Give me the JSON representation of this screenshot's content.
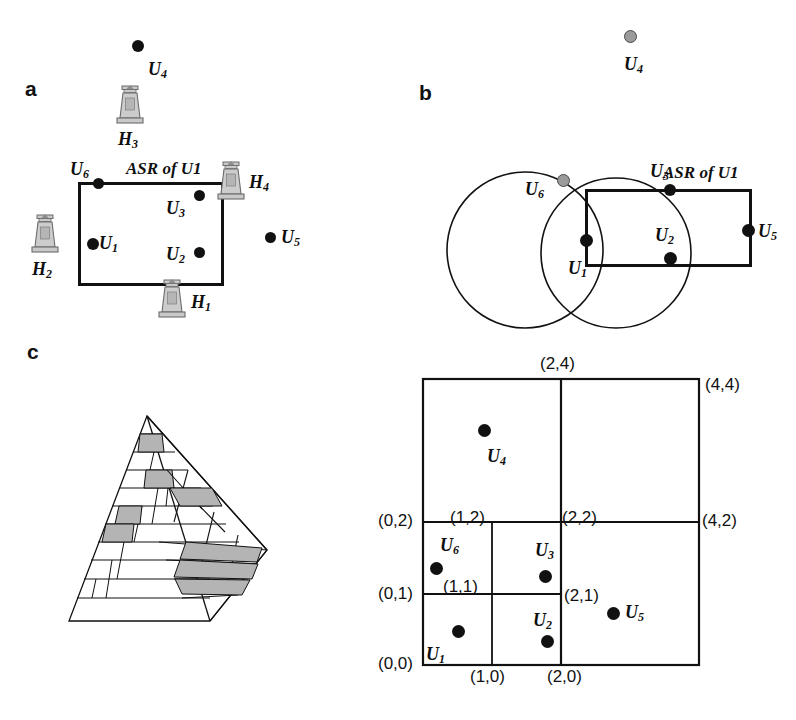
{
  "figure": {
    "panels": [
      {
        "id": "a",
        "label": "a",
        "caption": "ASR of U1",
        "users": [
          {
            "id": "U4",
            "label": "U",
            "sub": "4"
          },
          {
            "id": "U6",
            "label": "U",
            "sub": "6"
          },
          {
            "id": "U3",
            "label": "U",
            "sub": "3"
          },
          {
            "id": "U1",
            "label": "U",
            "sub": "1"
          },
          {
            "id": "U2",
            "label": "U",
            "sub": "2"
          },
          {
            "id": "U5",
            "label": "U",
            "sub": "5"
          }
        ],
        "base_stations": [
          {
            "id": "H3",
            "label": "H",
            "sub": "3"
          },
          {
            "id": "H4",
            "label": "H",
            "sub": "4"
          },
          {
            "id": "H2",
            "label": "H",
            "sub": "2"
          },
          {
            "id": "H1",
            "label": "H",
            "sub": "1"
          }
        ]
      },
      {
        "id": "b",
        "label": "b",
        "caption": "ASR of U1",
        "users": [
          {
            "id": "U4",
            "label": "U",
            "sub": "4"
          },
          {
            "id": "U6",
            "label": "U",
            "sub": "6"
          },
          {
            "id": "U3",
            "label": "U",
            "sub": "3"
          },
          {
            "id": "U1",
            "label": "U",
            "sub": "1"
          },
          {
            "id": "U2",
            "label": "U",
            "sub": "2"
          },
          {
            "id": "U5",
            "label": "U",
            "sub": "5"
          }
        ]
      },
      {
        "id": "c",
        "label": "c",
        "users": [
          {
            "id": "U4",
            "label": "U",
            "sub": "4"
          },
          {
            "id": "U6",
            "label": "U",
            "sub": "6"
          },
          {
            "id": "U3",
            "label": "U",
            "sub": "3"
          },
          {
            "id": "U1",
            "label": "U",
            "sub": "1"
          },
          {
            "id": "U2",
            "label": "U",
            "sub": "2"
          },
          {
            "id": "U5",
            "label": "U",
            "sub": "5"
          }
        ],
        "grid_coordinates": [
          "(2,4)",
          "(4,4)",
          "(0,2)",
          "(1,2)",
          "(2,2)",
          "(4,2)",
          "(0,1)",
          "(1,1)",
          "(2,1)",
          "(0,0)",
          "(1,0)",
          "(2,0)"
        ]
      }
    ],
    "colors": {
      "stroke": "#111111",
      "user_dot": "#111111",
      "inactive_dot": "#9a9a9a",
      "inactive_dot_border": "#4a4a4a",
      "tower_fill": "#c9c9c9",
      "tower_stroke": "#6b6b6b",
      "pyramid_shade": "#b4b4b4",
      "background": "#ffffff"
    },
    "labels": {
      "panel_a": "a",
      "panel_b": "b",
      "panel_c": "c",
      "asr_a": "ASR of U1",
      "asr_b": "ASR of U1",
      "u1": "U",
      "u1sub": "1",
      "u2": "U",
      "u2sub": "2",
      "u3": "U",
      "u3sub": "3",
      "u4": "U",
      "u4sub": "4",
      "u5": "U",
      "u5sub": "5",
      "u6": "U",
      "u6sub": "6",
      "h1": "H",
      "h1sub": "1",
      "h2": "H",
      "h2sub": "2",
      "h3": "H",
      "h3sub": "3",
      "h4": "H",
      "h4sub": "4",
      "c24": "(2,4)",
      "c44": "(4,4)",
      "c02": "(0,2)",
      "c12": "(1,2)",
      "c22": "(2,2)",
      "c42": "(4,2)",
      "c01": "(0,1)",
      "c11": "(1,1)",
      "c21": "(2,1)",
      "c00": "(0,0)",
      "c10": "(1,0)",
      "c20": "(2,0)"
    }
  }
}
